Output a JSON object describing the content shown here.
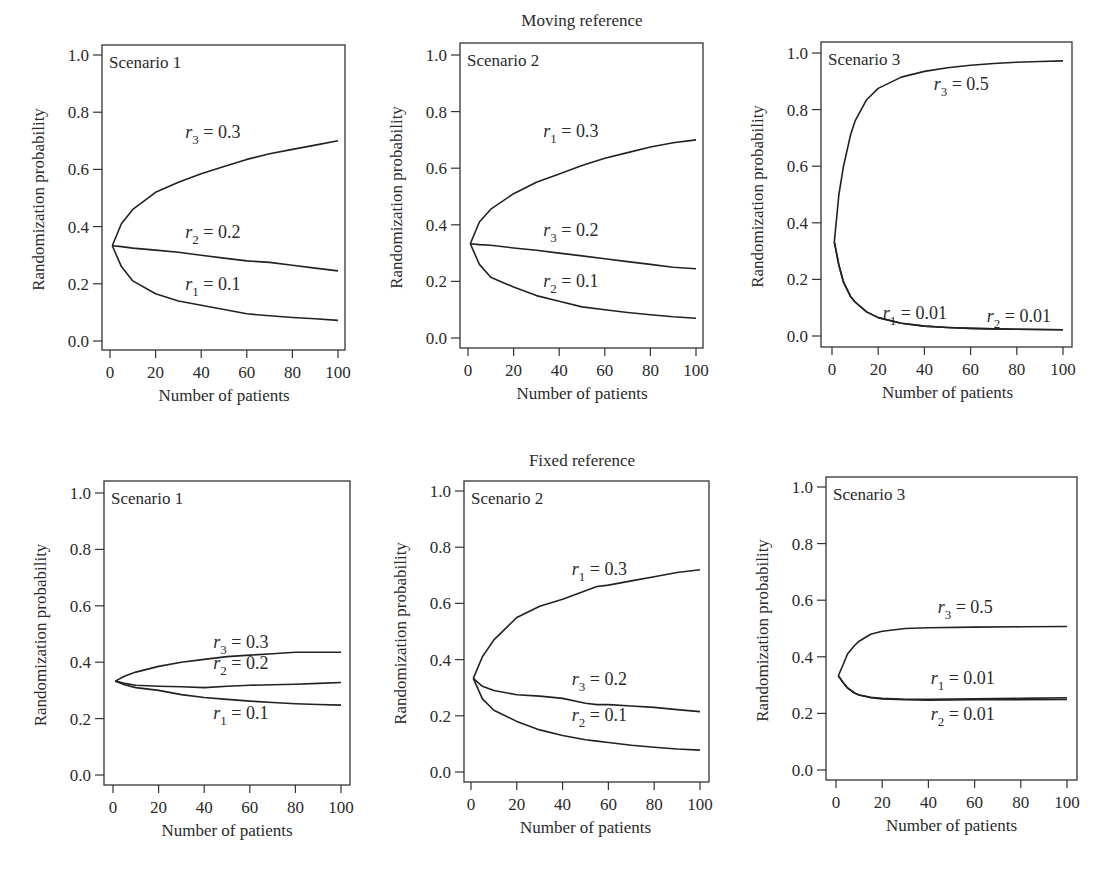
{
  "figure": {
    "row_titles": [
      "Moving reference",
      "Fixed reference"
    ]
  },
  "chart_data": [
    {
      "type": "line",
      "row": "Moving reference",
      "title": "Scenario 1",
      "xlabel": "Number of patients",
      "ylabel": "Randomization probability",
      "xlim": [
        0,
        100
      ],
      "ylim": [
        0,
        1
      ],
      "xticks": [
        0,
        20,
        40,
        60,
        80,
        100
      ],
      "yticks": [
        "0.0",
        "0.2",
        "0.4",
        "0.6",
        "0.8",
        "1.0"
      ],
      "grid": false,
      "x": [
        1,
        5,
        10,
        20,
        30,
        40,
        50,
        60,
        70,
        80,
        90,
        100
      ],
      "series": [
        {
          "name": "r3 = 0.3",
          "var": "r",
          "sub": "3",
          "val": "0.3",
          "values": [
            0.333,
            0.41,
            0.46,
            0.52,
            0.555,
            0.585,
            0.61,
            0.635,
            0.655,
            0.67,
            0.685,
            0.7
          ],
          "label_pos": [
            33,
            0.71
          ]
        },
        {
          "name": "r2 = 0.2",
          "var": "r",
          "sub": "2",
          "val": "0.2",
          "values": [
            0.333,
            0.33,
            0.325,
            0.318,
            0.31,
            0.3,
            0.29,
            0.28,
            0.275,
            0.265,
            0.255,
            0.245
          ],
          "label_pos": [
            33,
            0.36
          ]
        },
        {
          "name": "r1 = 0.1",
          "var": "r",
          "sub": "1",
          "val": "0.1",
          "values": [
            0.333,
            0.26,
            0.21,
            0.165,
            0.14,
            0.125,
            0.11,
            0.095,
            0.088,
            0.082,
            0.078,
            0.072
          ],
          "label_pos": [
            33,
            0.18
          ]
        }
      ]
    },
    {
      "type": "line",
      "row": "Moving reference",
      "title": "Scenario 2",
      "xlabel": "Number of patients",
      "ylabel": "Randomization probability",
      "xlim": [
        0,
        100
      ],
      "ylim": [
        0,
        1
      ],
      "xticks": [
        0,
        20,
        40,
        60,
        80,
        100
      ],
      "yticks": [
        "0.0",
        "0.2",
        "0.4",
        "0.6",
        "0.8",
        "1.0"
      ],
      "grid": false,
      "x": [
        1,
        5,
        10,
        20,
        30,
        40,
        50,
        60,
        70,
        80,
        90,
        100
      ],
      "series": [
        {
          "name": "r1 = 0.3",
          "var": "r",
          "sub": "1",
          "val": "0.3",
          "values": [
            0.333,
            0.41,
            0.455,
            0.51,
            0.55,
            0.58,
            0.61,
            0.635,
            0.655,
            0.675,
            0.69,
            0.7
          ],
          "label_pos": [
            33,
            0.71
          ]
        },
        {
          "name": "r3 = 0.2",
          "var": "r",
          "sub": "3",
          "val": "0.2",
          "values": [
            0.333,
            0.33,
            0.328,
            0.318,
            0.31,
            0.3,
            0.29,
            0.28,
            0.27,
            0.26,
            0.25,
            0.245
          ],
          "label_pos": [
            33,
            0.36
          ]
        },
        {
          "name": "r2 = 0.1",
          "var": "r",
          "sub": "2",
          "val": "0.1",
          "values": [
            0.333,
            0.26,
            0.215,
            0.18,
            0.15,
            0.13,
            0.11,
            0.1,
            0.09,
            0.082,
            0.075,
            0.07
          ],
          "label_pos": [
            33,
            0.18
          ]
        }
      ]
    },
    {
      "type": "line",
      "row": "Moving reference",
      "title": "Scenario 3",
      "xlabel": "Number of patients",
      "ylabel": "Randomization probability",
      "xlim": [
        0,
        100
      ],
      "ylim": [
        0,
        1
      ],
      "xticks": [
        0,
        20,
        40,
        60,
        80,
        100
      ],
      "yticks": [
        "0.0",
        "0.2",
        "0.4",
        "0.6",
        "0.8",
        "1.0"
      ],
      "grid": false,
      "x": [
        1,
        3,
        5,
        8,
        10,
        15,
        20,
        30,
        40,
        50,
        60,
        70,
        80,
        90,
        100
      ],
      "series": [
        {
          "name": "r3 = 0.5",
          "var": "r",
          "sub": "3",
          "val": "0.5",
          "values": [
            0.333,
            0.5,
            0.6,
            0.71,
            0.76,
            0.835,
            0.875,
            0.915,
            0.935,
            0.948,
            0.957,
            0.963,
            0.967,
            0.97,
            0.972
          ],
          "label_pos": [
            44,
            0.87
          ]
        },
        {
          "name": "r1 = 0.01",
          "var": "r",
          "sub": "1",
          "val": "0.01",
          "values": [
            0.333,
            0.25,
            0.19,
            0.14,
            0.12,
            0.085,
            0.065,
            0.045,
            0.035,
            0.03,
            0.027,
            0.025,
            0.024,
            0.023,
            0.022
          ],
          "label_pos": [
            22,
            0.06
          ]
        },
        {
          "name": "r2 = 0.01",
          "var": "r",
          "sub": "2",
          "val": "0.01",
          "values": [
            0.333,
            0.25,
            0.19,
            0.14,
            0.12,
            0.085,
            0.065,
            0.045,
            0.035,
            0.03,
            0.027,
            0.025,
            0.024,
            0.023,
            0.022
          ],
          "label_pos": [
            67,
            0.05
          ]
        }
      ]
    },
    {
      "type": "line",
      "row": "Fixed reference",
      "title": "Scenario 1",
      "xlabel": "Number of patients",
      "ylabel": "Randomization probability",
      "xlim": [
        0,
        100
      ],
      "ylim": [
        0,
        1
      ],
      "xticks": [
        0,
        20,
        40,
        60,
        80,
        100
      ],
      "yticks": [
        "0.0",
        "0.2",
        "0.4",
        "0.6",
        "0.8",
        "1.0"
      ],
      "grid": false,
      "x": [
        1,
        5,
        10,
        20,
        30,
        40,
        50,
        60,
        70,
        80,
        90,
        100
      ],
      "series": [
        {
          "name": "r3 = 0.3",
          "var": "r",
          "sub": "3",
          "val": "0.3",
          "values": [
            0.333,
            0.35,
            0.365,
            0.385,
            0.4,
            0.41,
            0.42,
            0.425,
            0.43,
            0.435,
            0.435,
            0.435
          ],
          "label_pos": [
            44,
            0.45
          ]
        },
        {
          "name": "r2 = 0.2",
          "var": "r",
          "sub": "2",
          "val": "0.2",
          "values": [
            0.333,
            0.325,
            0.318,
            0.315,
            0.313,
            0.31,
            0.315,
            0.318,
            0.32,
            0.322,
            0.325,
            0.328
          ],
          "label_pos": [
            44,
            0.375
          ]
        },
        {
          "name": "r1 = 0.1",
          "var": "r",
          "sub": "1",
          "val": "0.1",
          "values": [
            0.333,
            0.32,
            0.31,
            0.3,
            0.285,
            0.275,
            0.268,
            0.262,
            0.257,
            0.253,
            0.25,
            0.248
          ],
          "label_pos": [
            44,
            0.2
          ]
        }
      ]
    },
    {
      "type": "line",
      "row": "Fixed reference",
      "title": "Scenario 2",
      "xlabel": "Number of patients",
      "ylabel": "Randomization probability",
      "xlim": [
        0,
        100
      ],
      "ylim": [
        0,
        1
      ],
      "xticks": [
        0,
        20,
        40,
        60,
        80,
        100
      ],
      "yticks": [
        "0.0",
        "0.2",
        "0.4",
        "0.6",
        "0.8",
        "1.0"
      ],
      "grid": false,
      "x": [
        1,
        5,
        10,
        20,
        30,
        40,
        50,
        55,
        60,
        70,
        80,
        90,
        100
      ],
      "series": [
        {
          "name": "r1 = 0.3",
          "var": "r",
          "sub": "1",
          "val": "0.3",
          "values": [
            0.333,
            0.41,
            0.47,
            0.55,
            0.59,
            0.615,
            0.645,
            0.66,
            0.665,
            0.68,
            0.695,
            0.71,
            0.72
          ],
          "label_pos": [
            44,
            0.7
          ]
        },
        {
          "name": "r3 = 0.2",
          "var": "r",
          "sub": "3",
          "val": "0.2",
          "values": [
            0.333,
            0.305,
            0.29,
            0.275,
            0.27,
            0.262,
            0.245,
            0.24,
            0.24,
            0.235,
            0.23,
            0.222,
            0.215
          ],
          "label_pos": [
            44,
            0.31
          ]
        },
        {
          "name": "r2 = 0.1",
          "var": "r",
          "sub": "2",
          "val": "0.1",
          "values": [
            0.333,
            0.26,
            0.22,
            0.18,
            0.15,
            0.13,
            0.115,
            0.11,
            0.105,
            0.095,
            0.088,
            0.082,
            0.078
          ],
          "label_pos": [
            44,
            0.18
          ]
        }
      ]
    },
    {
      "type": "line",
      "row": "Fixed reference",
      "title": "Scenario 3",
      "xlabel": "Number of patients",
      "ylabel": "Randomization probability",
      "xlim": [
        0,
        100
      ],
      "ylim": [
        0,
        1
      ],
      "xticks": [
        0,
        20,
        40,
        60,
        80,
        100
      ],
      "yticks": [
        "0.0",
        "0.2",
        "0.4",
        "0.6",
        "0.8",
        "1.0"
      ],
      "grid": false,
      "x": [
        1,
        3,
        5,
        8,
        10,
        15,
        20,
        30,
        40,
        60,
        80,
        100
      ],
      "series": [
        {
          "name": "r3 = 0.5",
          "var": "r",
          "sub": "3",
          "val": "0.5",
          "values": [
            0.333,
            0.37,
            0.41,
            0.44,
            0.455,
            0.48,
            0.49,
            0.5,
            0.503,
            0.505,
            0.506,
            0.507
          ],
          "label_pos": [
            44,
            0.555
          ]
        },
        {
          "name": "r1 = 0.01",
          "var": "r",
          "sub": "1",
          "val": "0.01",
          "values": [
            0.333,
            0.31,
            0.29,
            0.272,
            0.265,
            0.257,
            0.253,
            0.25,
            0.25,
            0.252,
            0.253,
            0.255
          ],
          "label_pos": [
            41,
            0.305
          ]
        },
        {
          "name": "r2 = 0.01",
          "var": "r",
          "sub": "2",
          "val": "0.01",
          "values": [
            0.333,
            0.31,
            0.29,
            0.272,
            0.265,
            0.256,
            0.251,
            0.248,
            0.247,
            0.248,
            0.248,
            0.249
          ],
          "label_pos": [
            41,
            0.175
          ]
        }
      ]
    }
  ]
}
